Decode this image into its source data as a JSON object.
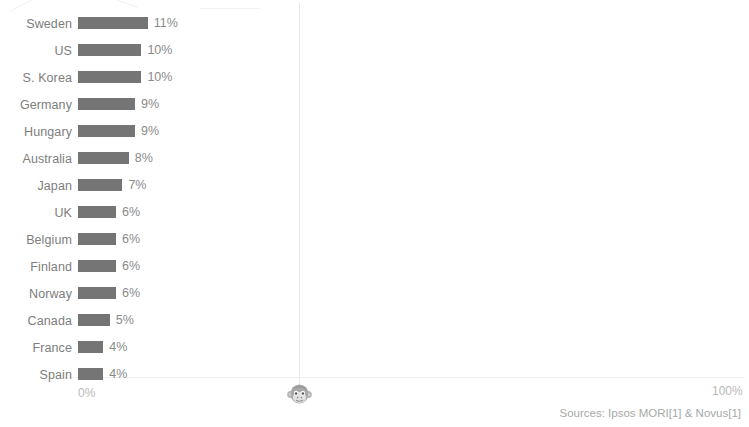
{
  "chart_data": {
    "type": "bar",
    "orientation": "horizontal",
    "title": "",
    "xlabel": "",
    "ylabel": "",
    "categories": [
      "Sweden",
      "US",
      "S. Korea",
      "Germany",
      "Hungary",
      "Australia",
      "Japan",
      "UK",
      "Belgium",
      "Finland",
      "Norway",
      "Canada",
      "France",
      "Spain"
    ],
    "values": [
      11,
      10,
      10,
      9,
      9,
      8,
      7,
      6,
      6,
      6,
      6,
      5,
      4,
      4
    ],
    "value_labels": [
      "11%",
      "10%",
      "10%",
      "9%",
      "9%",
      "8%",
      "7%",
      "6%",
      "6%",
      "6%",
      "6%",
      "5%",
      "4%",
      "4%"
    ],
    "xlim": [
      0,
      100
    ],
    "axis_ticks": [
      "0%",
      "100%"
    ],
    "grid": false,
    "legend": null,
    "bar_color": "#757575",
    "guide_line_at": 50
  },
  "axis": {
    "min_label": "0%",
    "max_label": "100%"
  },
  "icons": {
    "monkey": "monkey-face-icon"
  },
  "footer": {
    "sources": "Sources: Ipsos MORI[1] & Novus[1]"
  }
}
